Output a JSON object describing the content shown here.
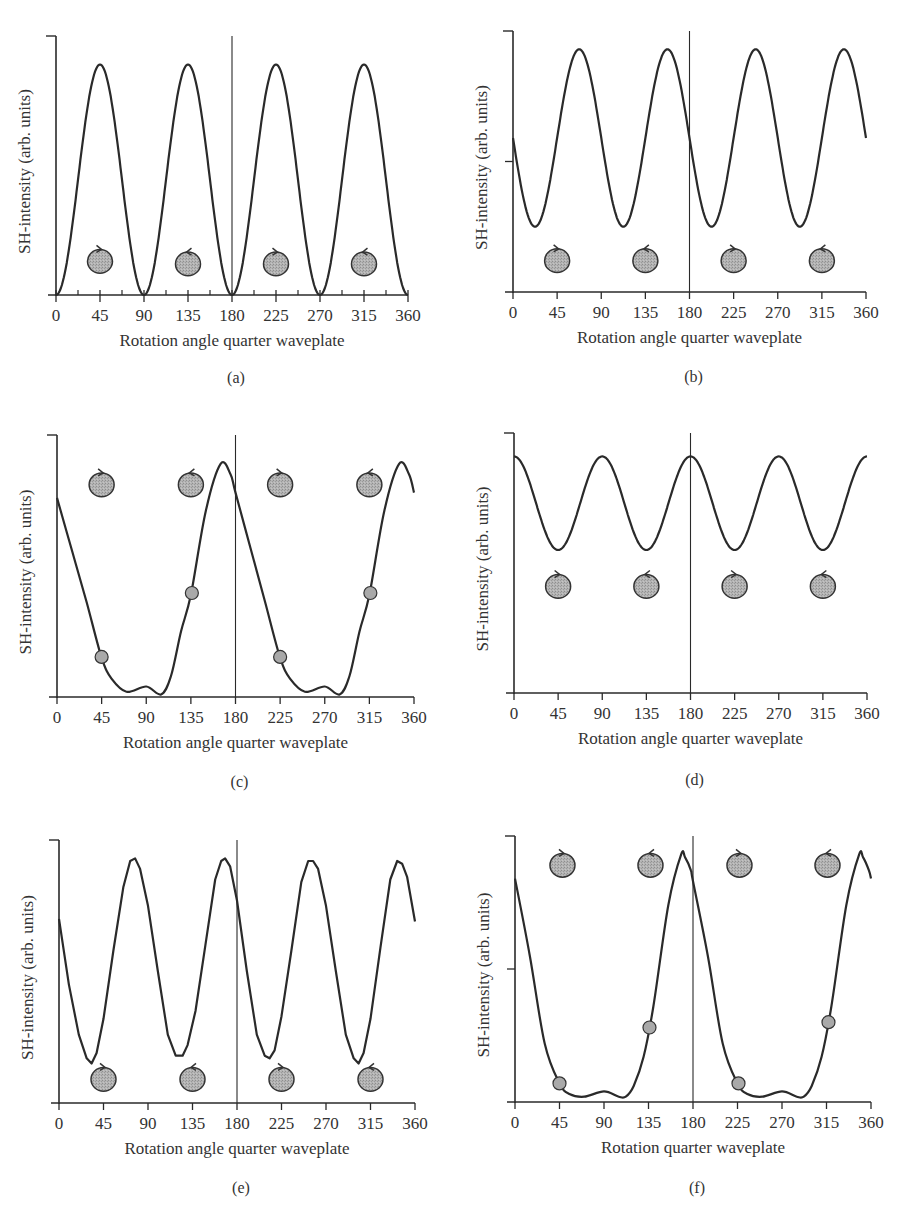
{
  "figure": {
    "panels": [
      "a",
      "b",
      "c",
      "d",
      "e",
      "f"
    ]
  },
  "colors": {
    "line": "#2a2a2a",
    "axis": "#2a2a2a",
    "marker_fill": "#a9a9a9",
    "marker_stroke": "#333333",
    "text": "#333333"
  },
  "chart_data": [
    {
      "id": "a",
      "type": "line",
      "caption": "(a)",
      "title": "",
      "xlabel": "Rotation angle quarter waveplate",
      "ylabel": "SH-intensity (arb. units)",
      "xticks": [
        0,
        45,
        90,
        135,
        180,
        225,
        270,
        315,
        360
      ],
      "minor_xticks": true,
      "xlim": [
        0,
        360
      ],
      "ylim": [
        0,
        1
      ],
      "ytick_mid": false,
      "vline_x": 180,
      "grid": false,
      "x": [
        0,
        22.5,
        45,
        67.5,
        90,
        112.5,
        135,
        157.5,
        180,
        202.5,
        225,
        247.5,
        270,
        292.5,
        315,
        337.5,
        360
      ],
      "y": [
        0,
        0.445,
        0.89,
        0.445,
        0,
        0.445,
        0.89,
        0.445,
        0,
        0.445,
        0.89,
        0.445,
        0,
        0.445,
        0.89,
        0.445,
        0
      ],
      "curve": {
        "kind": "sin2",
        "amp": 0.89,
        "offset": 0,
        "period": 90,
        "phase": 0
      },
      "polarization_markers": [
        {
          "x": 45,
          "y": 0.13,
          "rotation": "clockwise"
        },
        {
          "x": 135,
          "y": 0.12,
          "rotation": "counterclockwise"
        },
        {
          "x": 225,
          "y": 0.12,
          "rotation": "clockwise"
        },
        {
          "x": 315,
          "y": 0.12,
          "rotation": "counterclockwise"
        }
      ],
      "data_markers": [],
      "frame": {
        "x0": 56,
        "x1": 408,
        "y_top": 36,
        "y_base": 295,
        "caption_y": 383
      }
    },
    {
      "id": "b",
      "type": "line",
      "caption": "(b)",
      "title": "",
      "xlabel": "Rotation angle quarter waveplate",
      "ylabel": "SH-intensity (arb. units)",
      "xticks": [
        0,
        45,
        90,
        135,
        180,
        225,
        270,
        315,
        360
      ],
      "minor_xticks": false,
      "xlim": [
        0,
        360
      ],
      "ylim": [
        0,
        1
      ],
      "ytick_mid": true,
      "vline_x": 180,
      "grid": false,
      "x": [
        0,
        22.5,
        45,
        67.5,
        90,
        112.5,
        135,
        157.5,
        180,
        202.5,
        225,
        247.5,
        270,
        292.5,
        315,
        337.5,
        360
      ],
      "y": [
        0.67,
        0.26,
        0.42,
        0.93,
        0.67,
        0.26,
        0.42,
        0.93,
        0.67,
        0.26,
        0.42,
        0.93,
        0.67,
        0.26,
        0.42,
        0.93,
        0.67
      ],
      "curve": {
        "kind": "cos",
        "amp": 0.34,
        "offset": 0.59,
        "period": 90,
        "phase": 67.5
      },
      "polarization_markers": [
        {
          "x": 45,
          "y": 0.12,
          "rotation": "clockwise"
        },
        {
          "x": 135,
          "y": 0.12,
          "rotation": "counterclockwise"
        },
        {
          "x": 225,
          "y": 0.12,
          "rotation": "clockwise"
        },
        {
          "x": 315,
          "y": 0.12,
          "rotation": "counterclockwise"
        }
      ],
      "data_markers": [],
      "frame": {
        "x0": 513,
        "x1": 866,
        "y_top": 31,
        "y_base": 292,
        "caption_y": 382
      }
    },
    {
      "id": "c",
      "type": "line",
      "caption": "(c)",
      "title": "",
      "xlabel": "Rotation angle quarter waveplate",
      "ylabel": "SH-intensity (arb. units)",
      "xticks": [
        0,
        45,
        90,
        135,
        180,
        225,
        270,
        315,
        360
      ],
      "minor_xticks": false,
      "xlim": [
        0,
        360
      ],
      "ylim": [
        0,
        1
      ],
      "ytick_mid": false,
      "vline_x": 180,
      "grid": false,
      "x": [
        0,
        15,
        30,
        45,
        55,
        70,
        90,
        105,
        115,
        125,
        135,
        150,
        165,
        175,
        180,
        195,
        210,
        225,
        235,
        250,
        270,
        285,
        295,
        305,
        315,
        330,
        345,
        355,
        360
      ],
      "y": [
        0.76,
        0.56,
        0.36,
        0.15,
        0.07,
        0.02,
        0.04,
        0.01,
        0.08,
        0.25,
        0.39,
        0.71,
        0.89,
        0.85,
        0.78,
        0.57,
        0.36,
        0.15,
        0.07,
        0.02,
        0.04,
        0.01,
        0.08,
        0.25,
        0.39,
        0.71,
        0.89,
        0.85,
        0.78
      ],
      "curve": {
        "kind": "points"
      },
      "polarization_markers": [
        {
          "x": 45,
          "y": 0.81,
          "rotation": "clockwise"
        },
        {
          "x": 135,
          "y": 0.81,
          "rotation": "counterclockwise"
        },
        {
          "x": 225,
          "y": 0.81,
          "rotation": "clockwise"
        },
        {
          "x": 315,
          "y": 0.81,
          "rotation": "counterclockwise"
        }
      ],
      "data_markers": [
        {
          "x": 45,
          "y": 0.153
        },
        {
          "x": 136,
          "y": 0.397
        },
        {
          "x": 225,
          "y": 0.153
        },
        {
          "x": 316,
          "y": 0.397
        }
      ],
      "frame": {
        "x0": 57,
        "x1": 414,
        "y_top": 435,
        "y_base": 697,
        "caption_y": 787
      }
    },
    {
      "id": "d",
      "type": "line",
      "caption": "(d)",
      "title": "",
      "xlabel": "Rotation angle quarter waveplate",
      "ylabel": "SH-intensity (arb. units)",
      "xticks": [
        0,
        45,
        90,
        135,
        180,
        225,
        270,
        315,
        360
      ],
      "minor_xticks": false,
      "xlim": [
        0,
        360
      ],
      "ylim": [
        0,
        1
      ],
      "ytick_mid": false,
      "vline_x": 180,
      "grid": false,
      "x": [
        0,
        22.5,
        45,
        67.5,
        90,
        112.5,
        135,
        157.5,
        180,
        202.5,
        225,
        247.5,
        270,
        292.5,
        315,
        337.5,
        360
      ],
      "y": [
        0.91,
        0.73,
        0.55,
        0.73,
        0.91,
        0.73,
        0.55,
        0.73,
        0.91,
        0.73,
        0.55,
        0.73,
        0.91,
        0.73,
        0.55,
        0.73,
        0.91
      ],
      "curve": {
        "kind": "cos",
        "amp": 0.18,
        "offset": 0.73,
        "period": 90,
        "phase": 0
      },
      "polarization_markers": [
        {
          "x": 45,
          "y": 0.41,
          "rotation": "clockwise"
        },
        {
          "x": 135,
          "y": 0.41,
          "rotation": "counterclockwise"
        },
        {
          "x": 225,
          "y": 0.41,
          "rotation": "clockwise"
        },
        {
          "x": 315,
          "y": 0.41,
          "rotation": "counterclockwise"
        }
      ],
      "data_markers": [],
      "frame": {
        "x0": 514,
        "x1": 867,
        "y_top": 433,
        "y_base": 693,
        "caption_y": 785
      }
    },
    {
      "id": "e",
      "type": "line",
      "caption": "(e)",
      "title": "",
      "xlabel": "Rotation angle quarter waveplate",
      "ylabel": "SH-intensity (arb. units)",
      "xticks": [
        0,
        45,
        90,
        135,
        180,
        225,
        270,
        315,
        360
      ],
      "minor_xticks": false,
      "xlim": [
        0,
        360
      ],
      "ylim": [
        0,
        1
      ],
      "ytick_mid": false,
      "vline_x": 180,
      "grid": false,
      "x": [
        0,
        10,
        20,
        28,
        33,
        38,
        45,
        55,
        65,
        72,
        77,
        82,
        90,
        100,
        110,
        118,
        125,
        130,
        138,
        148,
        158,
        164,
        168,
        173,
        180,
        190,
        200,
        208,
        213,
        218,
        225,
        235,
        245,
        252,
        257,
        262,
        270,
        280,
        290,
        298,
        303,
        308,
        315,
        325,
        335,
        342,
        347,
        352,
        360
      ],
      "y": [
        0.7,
        0.45,
        0.26,
        0.17,
        0.15,
        0.19,
        0.32,
        0.58,
        0.82,
        0.92,
        0.93,
        0.89,
        0.75,
        0.5,
        0.26,
        0.18,
        0.18,
        0.22,
        0.35,
        0.6,
        0.85,
        0.92,
        0.93,
        0.9,
        0.77,
        0.5,
        0.26,
        0.18,
        0.17,
        0.2,
        0.33,
        0.58,
        0.84,
        0.92,
        0.92,
        0.89,
        0.75,
        0.5,
        0.26,
        0.17,
        0.15,
        0.19,
        0.32,
        0.59,
        0.85,
        0.92,
        0.91,
        0.86,
        0.69
      ],
      "curve": {
        "kind": "points_linear"
      },
      "polarization_markers": [
        {
          "x": 45,
          "y": 0.09,
          "rotation": "clockwise"
        },
        {
          "x": 135,
          "y": 0.09,
          "rotation": "counterclockwise"
        },
        {
          "x": 225,
          "y": 0.09,
          "rotation": "clockwise"
        },
        {
          "x": 315,
          "y": 0.09,
          "rotation": "counterclockwise"
        }
      ],
      "data_markers": [],
      "frame": {
        "x0": 59,
        "x1": 415,
        "y_top": 840,
        "y_base": 1103,
        "caption_y": 1193
      }
    },
    {
      "id": "f",
      "type": "line",
      "caption": "(f)",
      "title": "",
      "xlabel": "Rotation quarter waveplate",
      "ylabel": "SH-intensity (arb. units)",
      "xticks": [
        0,
        45,
        90,
        135,
        180,
        225,
        270,
        315,
        360
      ],
      "minor_xticks": false,
      "xlim": [
        0,
        360
      ],
      "ylim": [
        0,
        1
      ],
      "ytick_mid": true,
      "vline_x": 180,
      "grid": false,
      "x": [
        0,
        15,
        30,
        45,
        55,
        70,
        90,
        105,
        112,
        120,
        130,
        140,
        155,
        168,
        172,
        178,
        180,
        195,
        210,
        225,
        235,
        250,
        270,
        285,
        292,
        300,
        310,
        320,
        335,
        348,
        352,
        358,
        360
      ],
      "y": [
        0.84,
        0.55,
        0.22,
        0.07,
        0.03,
        0.02,
        0.04,
        0.02,
        0.02,
        0.06,
        0.17,
        0.36,
        0.74,
        0.93,
        0.92,
        0.87,
        0.83,
        0.55,
        0.22,
        0.07,
        0.03,
        0.02,
        0.04,
        0.02,
        0.02,
        0.06,
        0.17,
        0.36,
        0.74,
        0.93,
        0.92,
        0.87,
        0.84
      ],
      "curve": {
        "kind": "points"
      },
      "polarization_markers": [
        {
          "x": 48,
          "y": 0.89,
          "rotation": "clockwise"
        },
        {
          "x": 137,
          "y": 0.89,
          "rotation": "counterclockwise"
        },
        {
          "x": 227,
          "y": 0.89,
          "rotation": "clockwise"
        },
        {
          "x": 316,
          "y": 0.89,
          "rotation": "counterclockwise"
        }
      ],
      "data_markers": [
        {
          "x": 45,
          "y": 0.07
        },
        {
          "x": 136,
          "y": 0.28
        },
        {
          "x": 226,
          "y": 0.07
        },
        {
          "x": 317,
          "y": 0.3
        }
      ],
      "frame": {
        "x0": 515,
        "x1": 871,
        "y_top": 836,
        "y_base": 1102,
        "caption_y": 1193
      }
    }
  ]
}
